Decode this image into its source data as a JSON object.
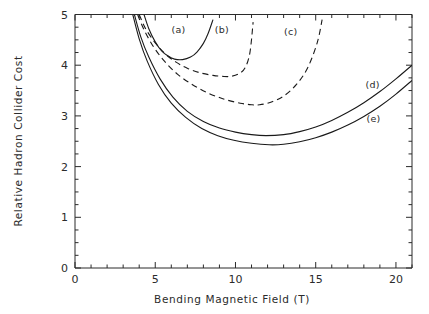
{
  "chart_data": {
    "type": "line",
    "title": "",
    "xlabel": "Bending Magnetic Field (T)",
    "ylabel": "Relative Hadron Collider Cost",
    "xlim": [
      0,
      21
    ],
    "ylim": [
      0,
      5
    ],
    "grid": false,
    "legend_position": "inline-annotations",
    "xticks": [
      0,
      5,
      10,
      15,
      20
    ],
    "xtick_labels": [
      "0",
      "5",
      "10",
      "15",
      "20"
    ],
    "x_minor_tick_step": 1,
    "yticks": [
      0,
      1,
      2,
      3,
      4,
      5
    ],
    "ytick_labels": [
      "0",
      "1",
      "2",
      "3",
      "4",
      "5"
    ],
    "y_minor_tick_step": 0.25,
    "annotations": [
      {
        "text": "(a)",
        "x": 6.45,
        "y": 4.63
      },
      {
        "text": "(b)",
        "x": 9.15,
        "y": 4.63
      },
      {
        "text": "(c)",
        "x": 13.45,
        "y": 4.6
      },
      {
        "text": "(d)",
        "x": 18.55,
        "y": 3.55
      },
      {
        "text": "(e)",
        "x": 18.6,
        "y": 2.88
      }
    ],
    "series": [
      {
        "name": "(a)",
        "style": "solid",
        "minimum": {
          "x": 6.7,
          "y": 4.11
        },
        "x": [
          4.3,
          4.6,
          5.0,
          5.4,
          5.8,
          6.2,
          6.7,
          7.2,
          7.6,
          8.0,
          8.3,
          8.6
        ],
        "values": [
          5.0,
          4.72,
          4.46,
          4.28,
          4.18,
          4.12,
          4.11,
          4.16,
          4.26,
          4.43,
          4.63,
          4.9
        ]
      },
      {
        "name": "(b)",
        "style": "dashed",
        "minimum": {
          "x": 9.7,
          "y": 3.78
        },
        "x": [
          4.0,
          4.4,
          5.0,
          5.6,
          6.3,
          7.0,
          7.8,
          8.6,
          9.2,
          9.7,
          10.2,
          10.6,
          10.9,
          11.1
        ],
        "values": [
          5.0,
          4.72,
          4.44,
          4.23,
          4.06,
          3.94,
          3.85,
          3.8,
          3.78,
          3.78,
          3.83,
          3.95,
          4.25,
          4.85
        ]
      },
      {
        "name": "(c)",
        "style": "dashed",
        "minimum": {
          "x": 11.5,
          "y": 3.22
        },
        "x": [
          3.9,
          4.3,
          4.9,
          5.6,
          6.4,
          7.3,
          8.3,
          9.3,
          10.3,
          11.0,
          11.5,
          12.2,
          13.0,
          13.8,
          14.5,
          15.1,
          15.4
        ],
        "values": [
          5.0,
          4.7,
          4.36,
          4.07,
          3.82,
          3.62,
          3.45,
          3.33,
          3.25,
          3.22,
          3.22,
          3.27,
          3.39,
          3.62,
          3.95,
          4.45,
          4.9
        ]
      },
      {
        "name": "(d)",
        "style": "solid",
        "minimum": {
          "x": 11.9,
          "y": 2.61
        },
        "x": [
          3.7,
          4.1,
          4.6,
          5.3,
          6.1,
          7.0,
          8.0,
          9.0,
          10.0,
          11.0,
          11.9,
          13.0,
          14.0,
          15.0,
          16.0,
          17.0,
          18.0,
          19.0,
          20.0,
          21.0
        ],
        "values": [
          5.0,
          4.56,
          4.16,
          3.73,
          3.37,
          3.09,
          2.89,
          2.76,
          2.68,
          2.63,
          2.61,
          2.63,
          2.69,
          2.78,
          2.91,
          3.07,
          3.26,
          3.48,
          3.73,
          4.0
        ]
      },
      {
        "name": "(e)",
        "style": "solid",
        "minimum": {
          "x": 12.1,
          "y": 2.43
        },
        "x": [
          3.6,
          4.0,
          4.5,
          5.2,
          6.0,
          6.9,
          7.9,
          8.9,
          9.9,
          11.0,
          12.1,
          13.0,
          14.0,
          15.0,
          16.0,
          17.0,
          18.0,
          19.0,
          20.0,
          21.0
        ],
        "values": [
          5.0,
          4.52,
          4.08,
          3.62,
          3.25,
          2.97,
          2.75,
          2.61,
          2.52,
          2.46,
          2.43,
          2.44,
          2.49,
          2.57,
          2.68,
          2.82,
          2.99,
          3.19,
          3.43,
          3.7
        ]
      }
    ]
  },
  "colors": {
    "axis": "#2b2b2b",
    "curve": "#1a1a1a",
    "background": "#ffffff"
  }
}
